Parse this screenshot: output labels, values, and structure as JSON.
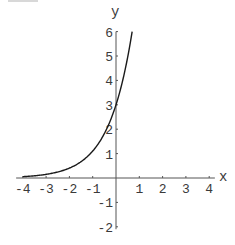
{
  "chart_data": {
    "type": "line",
    "title": "",
    "xlabel": "x",
    "ylabel": "y",
    "xlim": [
      -4.2,
      4.2
    ],
    "ylim": [
      -2.1,
      6
    ],
    "x_ticks": [
      -4,
      -3,
      -2,
      -1,
      1,
      2,
      3,
      4
    ],
    "y_ticks": [
      -2,
      -1,
      1,
      2,
      3,
      4,
      5,
      6
    ],
    "grid": false,
    "legend": null,
    "series": [
      {
        "name": "y = 3e^x",
        "x": [
          -4,
          -3.5,
          -3,
          -2.5,
          -2,
          -1.5,
          -1,
          -0.5,
          0,
          0.25,
          0.5,
          0.693
        ],
        "y": [
          0.055,
          0.091,
          0.149,
          0.246,
          0.406,
          0.669,
          1.104,
          1.82,
          3.0,
          3.852,
          4.946,
          6.0
        ],
        "color": "#1a1a1a"
      }
    ]
  },
  "colors": {
    "axis": "#555555",
    "curve": "#1a1a1a",
    "text": "#3a3a3a",
    "background": "#ffffff"
  }
}
